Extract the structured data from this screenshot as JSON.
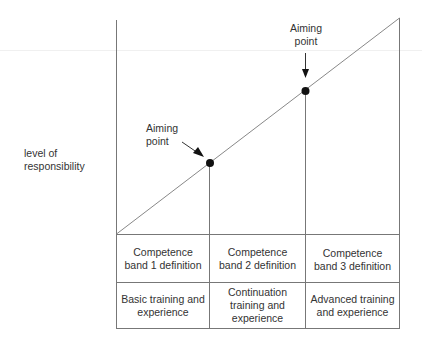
{
  "diagram": {
    "y_axis_label": "level of\nresponsibility",
    "aiming_points": [
      {
        "label_line1": "Aiming",
        "label_line2": "point",
        "band": 1
      },
      {
        "label_line1": "Aiming",
        "label_line2": "point",
        "band": 2
      }
    ],
    "table": {
      "rows": [
        {
          "name": "definition",
          "cells": [
            "Competence band 1 definition",
            "Competence band 2 definition",
            "Competence band 3 definition"
          ]
        },
        {
          "name": "training",
          "cells": [
            "Basic training and experience",
            "Continuation training and experience",
            "Advanced training and experience"
          ]
        }
      ]
    },
    "labels": {
      "y_axis_line1": "level of",
      "y_axis_line2": "responsibility",
      "ap1_line1": "Aiming",
      "ap1_line2": "point",
      "ap2_line1": "Aiming",
      "ap2_line2": "point",
      "r1c1_a": "Competence",
      "r1c1_b": "band 1 definition",
      "r1c2_a": "Competence",
      "r1c2_b": "band 2 definition",
      "r1c3_a": "Competence",
      "r1c3_b": "band 3 definition",
      "r2c1_a": "Basic training and",
      "r2c1_b": "experience",
      "r2c2_a": "Continuation",
      "r2c2_b": "training and",
      "r2c2_c": "experience",
      "r2c3_a": "Advanced training",
      "r2c3_b": "and experience"
    },
    "colors": {
      "line": "#777777",
      "dot": "#111111"
    }
  }
}
